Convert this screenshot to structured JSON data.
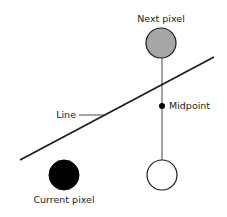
{
  "labels": {
    "next_pixel": "Next pixel",
    "midpoint": "Midpoint",
    "line": "Line",
    "current_pixel": "Current pixel"
  },
  "colors": {
    "next_pixel_fill": "#a6a6a6",
    "current_pixel_fill": "#000000",
    "candidate_pixel_fill": "#ffffff",
    "stroke": "#1a1a1a"
  }
}
